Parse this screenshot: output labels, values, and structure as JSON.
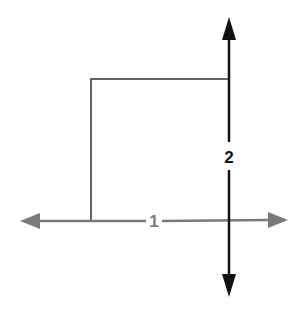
{
  "diagram": {
    "colors": {
      "background": "#ffffff",
      "horizontal_arrow": "#7a7a7a",
      "vertical_arrow": "#111111",
      "bracket_line": "#333333"
    },
    "horizontal_axis": {
      "label": "1",
      "direction": "bidirectional"
    },
    "vertical_axis": {
      "label": "2",
      "direction": "bidirectional"
    }
  }
}
